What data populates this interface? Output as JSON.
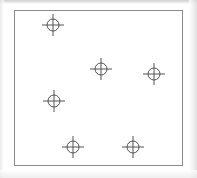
{
  "document": {
    "title": "Survey point diagram",
    "background_color": "#ffffff",
    "scan_artifact_color": "#d6d6d6"
  },
  "frame": {
    "name": "drawing-border",
    "stroke_color": "#8a8a8a",
    "stroke_width": 1,
    "x": 14,
    "y": 10,
    "width": 169,
    "height": 156
  },
  "chart_data": {
    "type": "scatter",
    "title": "",
    "subtitle": "",
    "xlabel": "",
    "ylabel": "",
    "grid": false,
    "legend": null,
    "axis_ticks": false,
    "marker_style": "crosshair-circle",
    "marker_color": "#555555",
    "marker_radius": 6,
    "crosshair_length": 11,
    "xlim": [
      0,
      169
    ],
    "ylim": [
      0,
      156
    ],
    "points": [
      {
        "label": "point-1",
        "x": 38,
        "y": 14
      },
      {
        "label": "point-2",
        "x": 86,
        "y": 58
      },
      {
        "label": "point-3",
        "x": 139,
        "y": 63
      },
      {
        "label": "point-4",
        "x": 39,
        "y": 90
      },
      {
        "label": "point-5",
        "x": 58,
        "y": 136
      },
      {
        "label": "point-6",
        "x": 118,
        "y": 136
      }
    ],
    "values": [
      [
        38,
        14
      ],
      [
        86,
        58
      ],
      [
        139,
        63
      ],
      [
        39,
        90
      ],
      [
        58,
        136
      ],
      [
        118,
        136
      ]
    ],
    "categories": [
      "point-1",
      "point-2",
      "point-3",
      "point-4",
      "point-5",
      "point-6"
    ]
  }
}
